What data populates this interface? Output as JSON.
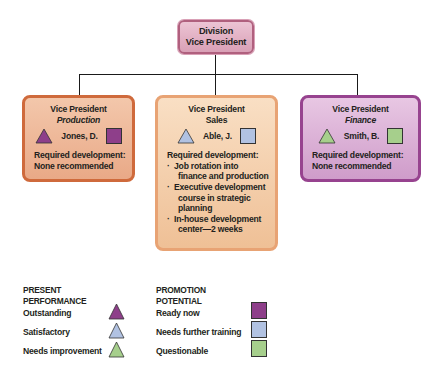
{
  "chart": {
    "top": {
      "line1": "Division",
      "line2": "Vice President",
      "color": "#d9a0b6"
    },
    "positions": [
      {
        "title": "Vice President",
        "department": "Production",
        "name": "Jones, D.",
        "performance": "Outstanding",
        "potential": "Ready now",
        "required_label": "Required development:",
        "development": [
          "None recommended"
        ],
        "border_color": "#cf6a3c"
      },
      {
        "title": "Vice President",
        "department": "Sales",
        "name": "Able, J.",
        "performance": "Satisfactory",
        "potential": "Needs further training",
        "required_label": "Required development:",
        "development": [
          "Job rotation into finance and production",
          "Executive development course in strategic planning",
          "In-house development center—2 weeks"
        ],
        "development_lines": [
          [
            "Job rotation into",
            "finance and production"
          ],
          [
            "Executive development",
            "course in strategic",
            "planning"
          ],
          [
            "In-house development",
            "center—2 weeks"
          ]
        ],
        "border_color": "#e8a374"
      },
      {
        "title": "Vice President",
        "department": "Finance",
        "name": "Smith, B.",
        "performance": "Needs improvement",
        "potential": "Questionable",
        "required_label": "Required development:",
        "development": [
          "None recommended"
        ],
        "border_color": "#97438f"
      }
    ]
  },
  "legend": {
    "performance": {
      "heading_line1": "PRESENT",
      "heading_line2": "PERFORMANCE",
      "items": [
        {
          "label": "Outstanding",
          "shape": "triangle",
          "color": "#8e3f8a"
        },
        {
          "label": "Satisfactory",
          "shape": "triangle",
          "color": "#b1c2e2"
        },
        {
          "label": "Needs improvement",
          "shape": "triangle",
          "color": "#a6cf8c"
        }
      ]
    },
    "potential": {
      "heading_line1": "PROMOTION",
      "heading_line2": "POTENTIAL",
      "items": [
        {
          "label": "Ready now",
          "shape": "square",
          "color": "#8e3f8a"
        },
        {
          "label": "Needs further training",
          "shape": "square",
          "color": "#b1c2e2"
        },
        {
          "label": "Questionable",
          "shape": "square",
          "color": "#a6cf8c"
        }
      ]
    }
  }
}
